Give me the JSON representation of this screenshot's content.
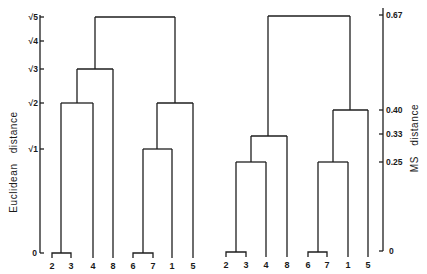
{
  "figure": {
    "left_panel": {
      "axis_label": "Euclidean   distance",
      "ticks": [
        {
          "label": "√5",
          "value": 2.236,
          "y": 17
        },
        {
          "label": "√4",
          "value": 2.0,
          "y": 41
        },
        {
          "label": "√3",
          "value": 1.732,
          "y": 69
        },
        {
          "label": "√2",
          "value": 1.414,
          "y": 103
        },
        {
          "label": "√1",
          "value": 1.0,
          "y": 149
        },
        {
          "label": "0",
          "value": 0,
          "y": 253
        }
      ],
      "leaves": [
        {
          "label": "2",
          "x": 52
        },
        {
          "label": "3",
          "x": 71
        },
        {
          "label": "4",
          "x": 93
        },
        {
          "label": "8",
          "x": 113
        },
        {
          "label": "6",
          "x": 133
        },
        {
          "label": "7",
          "x": 153
        },
        {
          "label": "1",
          "x": 172
        },
        {
          "label": "5",
          "x": 193
        }
      ],
      "merges": [
        {
          "members": [
            "2",
            "3"
          ],
          "height": "0"
        },
        {
          "members": [
            "6",
            "7"
          ],
          "height": "0"
        },
        {
          "members": [
            "6,7",
            "1"
          ],
          "height": "√1"
        },
        {
          "members": [
            "2,3",
            "4"
          ],
          "height": "√2"
        },
        {
          "members": [
            "6,7,1",
            "5"
          ],
          "height": "√2"
        },
        {
          "members": [
            "2,3,4",
            "8"
          ],
          "height": "√3"
        },
        {
          "members": [
            "2,3,4,8",
            "6,7,1,5"
          ],
          "height": "√5"
        }
      ]
    },
    "right_panel": {
      "axis_label": "MS   distance",
      "ticks": [
        {
          "label": "0.67",
          "value": 0.67,
          "y": 15
        },
        {
          "label": "0.40",
          "value": 0.4,
          "y": 110
        },
        {
          "label": "0.33",
          "value": 0.33,
          "y": 134
        },
        {
          "label": "0.25",
          "value": 0.25,
          "y": 162
        },
        {
          "label": "0",
          "value": 0,
          "y": 251
        }
      ],
      "leaves": [
        {
          "label": "2",
          "x": 226
        },
        {
          "label": "3",
          "x": 246
        },
        {
          "label": "4",
          "x": 266
        },
        {
          "label": "8",
          "x": 287
        },
        {
          "label": "6",
          "x": 308
        },
        {
          "label": "7",
          "x": 327
        },
        {
          "label": "1",
          "x": 348
        },
        {
          "label": "5",
          "x": 368
        }
      ],
      "merges": [
        {
          "members": [
            "2",
            "3"
          ],
          "height": "0"
        },
        {
          "members": [
            "6",
            "7"
          ],
          "height": "0"
        },
        {
          "members": [
            "2,3",
            "4"
          ],
          "height": "0.25"
        },
        {
          "members": [
            "6,7",
            "1"
          ],
          "height": "0.25"
        },
        {
          "members": [
            "2,3,4",
            "8"
          ],
          "height": "0.33"
        },
        {
          "members": [
            "6,7,1",
            "5"
          ],
          "height": "0.40"
        },
        {
          "members": [
            "2,3,4,8",
            "6,7,1,5"
          ],
          "height": "0.67"
        }
      ]
    }
  }
}
